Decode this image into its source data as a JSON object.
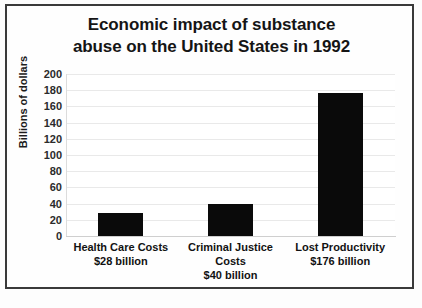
{
  "chart_data": {
    "type": "bar",
    "title": "Economic impact of substance abuse on the United States in 1992",
    "title_line1": "Economic impact of substance",
    "title_line2": "abuse on the United States in 1992",
    "categories": [
      "Health Care Costs",
      "Criminal Justice Costs",
      "Lost Productivity"
    ],
    "values": [
      28,
      40,
      176
    ],
    "value_labels": [
      "$28 billion",
      "$40 billion",
      "$176 billion"
    ],
    "xlabel": "",
    "ylabel": "Billions of dollars",
    "ylim": [
      0,
      200
    ],
    "ytick_step": 20,
    "yticks": [
      200,
      180,
      160,
      140,
      120,
      100,
      80,
      60,
      40,
      20,
      0
    ],
    "grid": true,
    "legend": false,
    "bar_color": "#0a0a0a",
    "gridline_color": "#e9e9e9",
    "text_color": "#151515"
  },
  "figure": {
    "caption": ""
  }
}
